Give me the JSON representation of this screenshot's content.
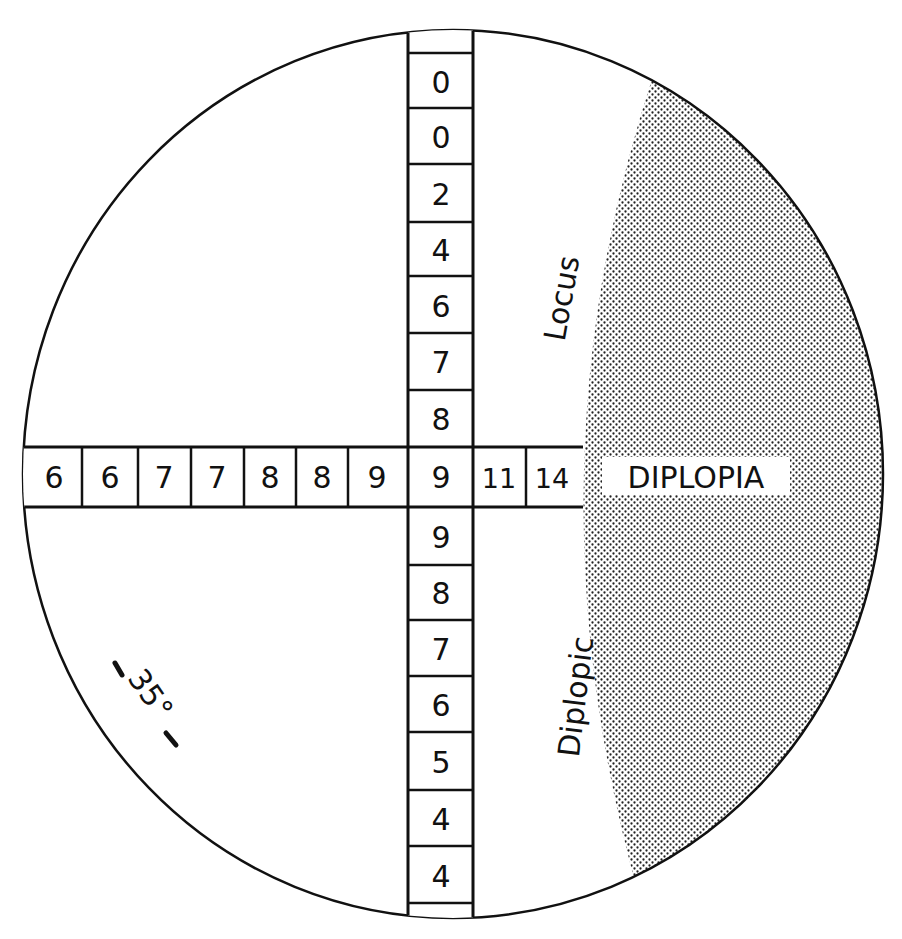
{
  "diagram": {
    "type": "diplopia-field-chart",
    "colors": {
      "line": "#111111",
      "background": "#ffffff",
      "shade_dot": "#222222"
    },
    "vertical_column": {
      "upper_values": [
        "0",
        "0",
        "2",
        "4",
        "6",
        "7",
        "8"
      ],
      "center_value": "9",
      "lower_values": [
        "9",
        "8",
        "7",
        "6",
        "5",
        "4",
        "4"
      ]
    },
    "horizontal_row": {
      "left_values": [
        "6",
        "6",
        "7",
        "7",
        "8",
        "8",
        "9"
      ],
      "center_value": "9",
      "right_values": [
        "11",
        "14"
      ]
    },
    "labels": {
      "diplopia": "DIPLOPIA",
      "locus": "Locus",
      "diplopic": "Diplopic",
      "angle": "35°"
    },
    "shaded_region": {
      "meaning": "diplopic-field",
      "pattern": "halftone-dots"
    }
  }
}
